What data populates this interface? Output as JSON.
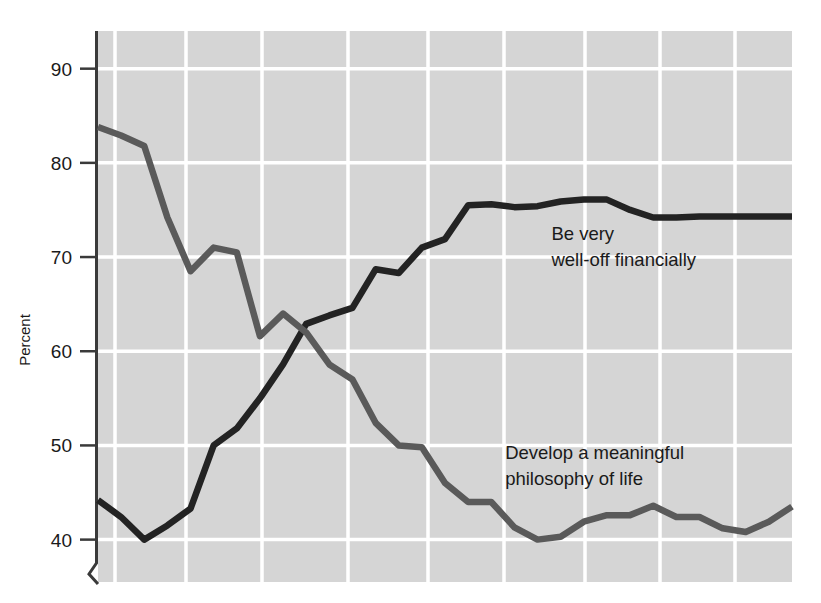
{
  "chart_data": {
    "type": "line",
    "title": "",
    "subtitle": "",
    "xlabel": "",
    "ylabel": "Percent",
    "ylim": [
      35.5,
      94.0
    ],
    "yticks": [
      40,
      50,
      60,
      70,
      80,
      90
    ],
    "ytick_labels": [
      "40",
      "50",
      "60",
      "70",
      "80",
      "90"
    ],
    "xlim": [
      0,
      30
    ],
    "xticks": [],
    "xtick_labels": [],
    "grid": true,
    "grid_color": "#ffffff",
    "plot_background": "#d5d5d5",
    "axis_break": true,
    "legend_position": "inline-annotations",
    "x": [
      0,
      1,
      2,
      3,
      4,
      5,
      6,
      7,
      8,
      9,
      10,
      11,
      12,
      13,
      14,
      15,
      16,
      17,
      18,
      19,
      20,
      21,
      22,
      23,
      24,
      25,
      26,
      27,
      28,
      29,
      30
    ],
    "series": [
      {
        "name": "Be very well-off financially",
        "color": "#232323",
        "label_lines": [
          "Be very",
          "well-off financially"
        ],
        "label_x": 19.6,
        "label_y": 71.8,
        "values": [
          44.2,
          42.4,
          40.0,
          41.5,
          43.3,
          50.0,
          51.8,
          55.0,
          58.6,
          62.9,
          63.8,
          64.6,
          68.7,
          68.3,
          71.0,
          71.9,
          75.5,
          75.6,
          75.3,
          75.4,
          75.9,
          76.1,
          76.1,
          75.0,
          74.2,
          74.2,
          74.3,
          74.3,
          74.3,
          74.3,
          74.3
        ]
      },
      {
        "name": "Develop a meaningful philosophy of life",
        "color": "#5a5a5a",
        "label_lines": [
          "Develop a meaningful",
          "philosophy of life"
        ],
        "label_x": 17.6,
        "label_y": 48.6,
        "values": [
          83.8,
          82.9,
          81.8,
          74.2,
          68.5,
          71.0,
          70.5,
          61.6,
          64.0,
          62.0,
          58.6,
          57.0,
          52.4,
          50.0,
          49.8,
          46.0,
          44.0,
          44.0,
          41.3,
          40.0,
          40.3,
          41.9,
          42.6,
          42.6,
          43.6,
          42.4,
          42.4,
          41.2,
          40.8,
          41.9,
          43.5
        ]
      }
    ]
  },
  "axis": {
    "y_label": "Percent",
    "tick_labels": [
      "90",
      "80",
      "70",
      "60",
      "50",
      "40"
    ]
  },
  "annotations": {
    "well_off_line1": "Be very",
    "well_off_line2": "well-off financially",
    "philosophy_line1": "Develop a meaningful",
    "philosophy_line2": "philosophy of life"
  }
}
